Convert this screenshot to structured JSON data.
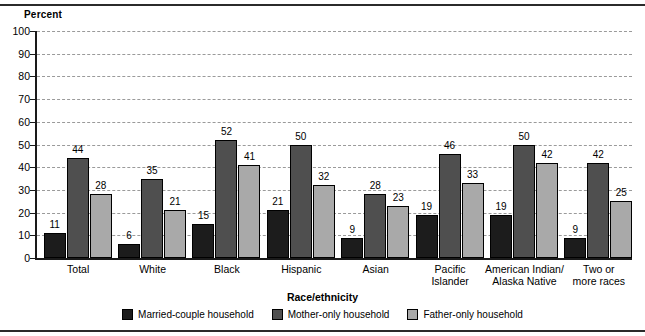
{
  "chart_data": {
    "type": "bar",
    "title": "",
    "ylabel": "Percent",
    "xlabel": "Race/ethnicity",
    "ylim": [
      0,
      100
    ],
    "yticks": [
      0,
      10,
      20,
      30,
      40,
      50,
      60,
      70,
      80,
      90,
      100
    ],
    "grid": true,
    "legend_position": "bottom",
    "categories": [
      "Total",
      "White",
      "Black",
      "Hispanic",
      "Asian",
      "Pacific\nIslander",
      "American Indian/\nAlaska Native",
      "Two or\nmore races"
    ],
    "category_lines": [
      [
        "Total"
      ],
      [
        "White"
      ],
      [
        "Black"
      ],
      [
        "Hispanic"
      ],
      [
        "Asian"
      ],
      [
        "Pacific",
        "Islander"
      ],
      [
        "American Indian/",
        "Alaska Native"
      ],
      [
        "Two or",
        "more races"
      ]
    ],
    "series": [
      {
        "name": "Married-couple household",
        "color": "#1c1c1c",
        "values": [
          11,
          6,
          15,
          21,
          9,
          19,
          19,
          9
        ]
      },
      {
        "name": "Mother-only household",
        "color": "#4f4f4f",
        "values": [
          44,
          35,
          52,
          50,
          28,
          46,
          50,
          42
        ]
      },
      {
        "name": "Father-only household",
        "color": "#a9a9a9",
        "values": [
          28,
          21,
          41,
          32,
          23,
          33,
          42,
          25
        ]
      }
    ]
  },
  "legend": {
    "items": [
      {
        "label": "Married-couple household",
        "color": "#1c1c1c"
      },
      {
        "label": "Mother-only household",
        "color": "#4f4f4f"
      },
      {
        "label": "Father-only household",
        "color": "#a9a9a9"
      }
    ]
  }
}
